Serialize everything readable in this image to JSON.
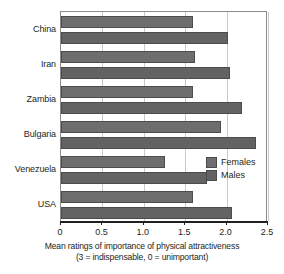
{
  "chart_data": {
    "type": "bar",
    "orientation": "horizontal",
    "title": "",
    "xlabel": "Mean ratings of importance of physical attractiveness",
    "xlabel_note": "(3 = indispensable, 0 = unimportant)",
    "ylabel": "",
    "categories": [
      "China",
      "Iran",
      "Zambia",
      "Bulgaria",
      "Venezuela",
      "USA"
    ],
    "series": [
      {
        "name": "Females",
        "color": "#6e6e6e",
        "values": [
          1.6,
          1.62,
          1.6,
          1.93,
          1.26,
          1.6
        ]
      },
      {
        "name": "Males",
        "color": "#636363",
        "values": [
          2.02,
          2.04,
          2.18,
          2.35,
          1.76,
          2.07
        ]
      }
    ],
    "xlim": [
      0,
      2.5
    ],
    "xticks": [
      0,
      0.5,
      1.0,
      1.5,
      2.0,
      2.5
    ],
    "xtick_labels": [
      "0",
      "0.5",
      "1.0",
      "1.5",
      "2.0",
      "2.5"
    ],
    "grid": true,
    "grid_axis": "x",
    "legend_position": "inside-right"
  },
  "legend": {
    "entries": [
      {
        "label": "Females"
      },
      {
        "label": "Males"
      }
    ]
  },
  "axis": {
    "x_title": "Mean ratings of importance of physical attractiveness",
    "x_subtitle": "(3 = indispensable, 0 = unimportant)"
  }
}
